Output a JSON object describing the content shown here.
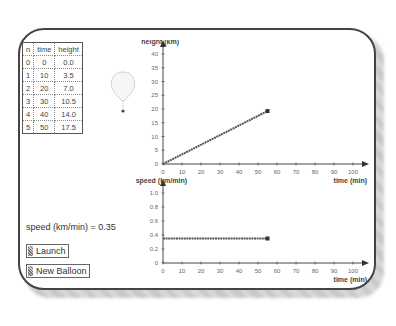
{
  "table": {
    "headers": [
      "n",
      "time",
      "height"
    ],
    "rows": [
      [
        "0",
        "0",
        "0.0"
      ],
      [
        "1",
        "10",
        "3.5"
      ],
      [
        "2",
        "20",
        "7.0"
      ],
      [
        "3",
        "30",
        "10.5"
      ],
      [
        "4",
        "40",
        "14.0"
      ],
      [
        "5",
        "50",
        "17.5"
      ]
    ]
  },
  "speed_label": "speed (km/min) = 0.35",
  "buttons": {
    "launch": "Launch",
    "new_balloon": "New Balloon"
  },
  "chart_data": [
    {
      "type": "line",
      "title": "",
      "ylabel": "height (km)",
      "xlabel": "time (min)",
      "xlim": [
        0,
        100
      ],
      "ylim": [
        0,
        40
      ],
      "x_ticks": [
        "0",
        "10",
        "20",
        "30",
        "40",
        "50",
        "60",
        "70",
        "80",
        "90",
        "100"
      ],
      "y_ticks": [
        "0",
        "5",
        "10",
        "15",
        "20",
        "25",
        "30",
        "35",
        "40"
      ],
      "series": [
        {
          "name": "height",
          "x": [
            0,
            55
          ],
          "y": [
            0,
            19.25
          ]
        }
      ]
    },
    {
      "type": "line",
      "title": "",
      "ylabel": "speed (km/min)",
      "xlabel": "time (min)",
      "xlim": [
        0,
        100
      ],
      "ylim": [
        0,
        1.0
      ],
      "x_ticks": [
        "0",
        "10",
        "20",
        "30",
        "40",
        "50",
        "60",
        "70",
        "80",
        "90",
        "100"
      ],
      "y_ticks": [
        "0",
        "0.2",
        "0.4",
        "0.6",
        "0.8",
        "1.0"
      ],
      "series": [
        {
          "name": "speed",
          "x": [
            0,
            55
          ],
          "y": [
            0.35,
            0.35
          ]
        }
      ]
    }
  ],
  "colors": {
    "frame": "#444444",
    "line": "#555555",
    "text": "#333333"
  }
}
